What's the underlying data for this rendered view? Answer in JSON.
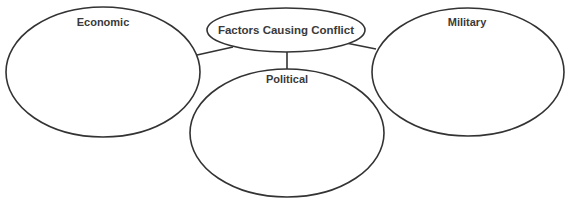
{
  "diagram": {
    "type": "concept-web",
    "central_node": {
      "id": "center",
      "label": "Factors Causing Conflict"
    },
    "nodes": [
      {
        "id": "economic",
        "label": "Economic",
        "content": ""
      },
      {
        "id": "political",
        "label": "Political",
        "content": ""
      },
      {
        "id": "military",
        "label": "Military",
        "content": ""
      }
    ],
    "edges": [
      {
        "from": "center",
        "to": "economic"
      },
      {
        "from": "center",
        "to": "political"
      },
      {
        "from": "center",
        "to": "military"
      }
    ],
    "colors": {
      "stroke": "#333333",
      "text": "#3a3a3a",
      "background": "#ffffff"
    }
  }
}
